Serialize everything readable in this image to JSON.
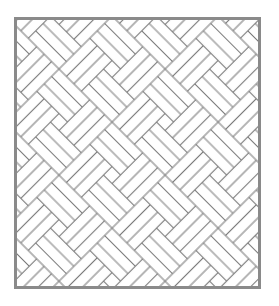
{
  "figure": {
    "pattern": "pinwheel-basket-weave",
    "rotation_deg": 45,
    "planks_per_bundle": 3,
    "colors": {
      "background": "#ffffff",
      "line": "#7a7a7a",
      "border": "#8a8a8a"
    }
  }
}
